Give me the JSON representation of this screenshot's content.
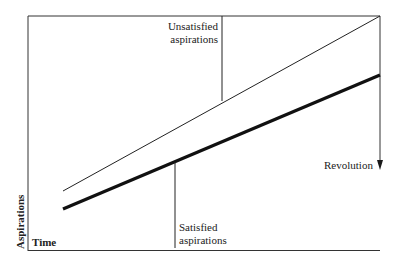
{
  "diagram": {
    "axis_labels": {
      "y": "Aspirations",
      "x": "Time"
    },
    "annotations": {
      "unsatisfied": [
        "Unsatisfied",
        "aspirations"
      ],
      "satisfied": [
        "Satisfied",
        "aspirations"
      ],
      "revolution": "Revolution"
    },
    "lines": [
      {
        "name": "expected need satisfaction",
        "style": "thin",
        "from": [
          63,
          191
        ],
        "to": [
          380,
          16
        ]
      },
      {
        "name": "actual need satisfaction",
        "style": "thick",
        "from": [
          63,
          209
        ],
        "to": [
          380,
          75
        ]
      }
    ],
    "colors": {
      "ink": "#1a1a1a",
      "background": "#ffffff"
    }
  }
}
